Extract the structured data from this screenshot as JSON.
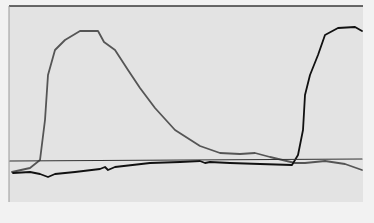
{
  "chart_data": {
    "type": "line",
    "title": "",
    "xlabel": "",
    "ylabel": "",
    "grid": false,
    "legend": null,
    "colors": {
      "background": "#e3e3e3",
      "frame": "#3a3a3a",
      "series_gray": "#555555",
      "series_black": "#111111",
      "baseline": "#333333"
    },
    "series": [
      {
        "name": "gray-curve",
        "color": "#555555",
        "points": [
          [
            12,
            172
          ],
          [
            30,
            168
          ],
          [
            40,
            160
          ],
          [
            45,
            120
          ],
          [
            48,
            75
          ],
          [
            55,
            50
          ],
          [
            65,
            40
          ],
          [
            80,
            31
          ],
          [
            98,
            31
          ],
          [
            104,
            42
          ],
          [
            115,
            50
          ],
          [
            128,
            70
          ],
          [
            140,
            88
          ],
          [
            155,
            108
          ],
          [
            175,
            130
          ],
          [
            200,
            146
          ],
          [
            220,
            153
          ],
          [
            240,
            154
          ],
          [
            255,
            153
          ],
          [
            270,
            157
          ],
          [
            295,
            163
          ],
          [
            305,
            163
          ],
          [
            325,
            161
          ],
          [
            345,
            164
          ],
          [
            362,
            170
          ]
        ]
      },
      {
        "name": "black-curve",
        "color": "#111111",
        "points": [
          [
            13,
            173
          ],
          [
            30,
            172
          ],
          [
            40,
            174
          ],
          [
            48,
            177
          ],
          [
            55,
            174
          ],
          [
            75,
            172
          ],
          [
            100,
            169
          ],
          [
            105,
            167
          ],
          [
            108,
            170
          ],
          [
            115,
            167
          ],
          [
            150,
            163
          ],
          [
            180,
            162
          ],
          [
            200,
            161
          ],
          [
            205,
            163
          ],
          [
            210,
            162
          ],
          [
            230,
            163
          ],
          [
            260,
            164
          ],
          [
            292,
            165
          ],
          [
            298,
            155
          ],
          [
            303,
            130
          ],
          [
            305,
            95
          ],
          [
            310,
            75
          ],
          [
            318,
            55
          ],
          [
            325,
            35
          ],
          [
            338,
            28
          ],
          [
            355,
            27
          ],
          [
            362,
            31
          ]
        ]
      },
      {
        "name": "baseline",
        "color": "#333333",
        "points": [
          [
            10,
            161
          ],
          [
            362,
            159
          ]
        ]
      }
    ],
    "plot_area": {
      "x": 9,
      "y": 6,
      "width": 354,
      "height": 196
    }
  }
}
